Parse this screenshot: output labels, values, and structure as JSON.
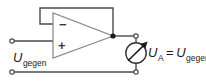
{
  "figure": {
    "background_color": "#ffffff",
    "wire_color": "#4a4a4a",
    "text_color": "#1a1a1a"
  },
  "opamp": {
    "name": "operational-amplifier",
    "inverting_input_label": "−",
    "noninverting_input_label": "+",
    "body_fill": "#ffffff",
    "body_stroke": "#8c8c8c"
  },
  "labels": {
    "input_voltage": {
      "symbol": "U",
      "subscript": "gegen"
    },
    "output_voltage": {
      "symbol": "U",
      "subscript": "A",
      "operator": "=",
      "equals_symbol": "U",
      "equals_subscript": "gegen"
    }
  },
  "meter": {
    "name": "voltmeter",
    "glyph": "arrow-diagonal",
    "stroke": "#333333"
  },
  "terminals": [
    {
      "name": "input-positive-terminal"
    },
    {
      "name": "input-negative-terminal"
    },
    {
      "name": "output-positive-terminal"
    },
    {
      "name": "output-negative-terminal"
    }
  ],
  "nodes": [
    {
      "name": "output-junction-node"
    }
  ]
}
